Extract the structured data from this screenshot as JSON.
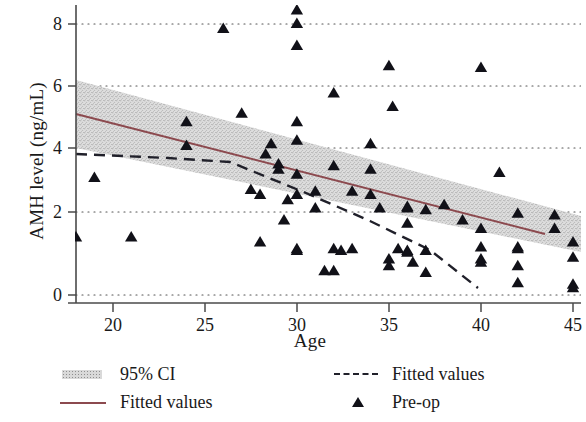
{
  "chart_data": {
    "type": "scatter",
    "title": "",
    "xlabel": "Age",
    "ylabel": "AMH level (ng/mL)",
    "xlim": [
      18,
      45.6
    ],
    "ylim": [
      -0.45,
      8.75
    ],
    "xticks": [
      20,
      25,
      30,
      35,
      40,
      45
    ],
    "yticks": [
      0,
      2,
      4,
      6,
      8
    ],
    "grid": "horizontal dotted gridlines at each y tick",
    "legend_position": "below plot, two columns",
    "series": [
      {
        "name": "Pre-op",
        "type": "scatter",
        "marker": "triangle",
        "color": "#111118",
        "points": [
          [
            18.0,
            1.7
          ],
          [
            19.0,
            3.45
          ],
          [
            21.0,
            1.7
          ],
          [
            24.0,
            4.4
          ],
          [
            24.0,
            5.1
          ],
          [
            26.0,
            7.85
          ],
          [
            27.0,
            5.35
          ],
          [
            27.5,
            3.1
          ],
          [
            28.0,
            1.55
          ],
          [
            28.0,
            2.95
          ],
          [
            28.3,
            4.15
          ],
          [
            28.6,
            4.45
          ],
          [
            29.0,
            3.85
          ],
          [
            29.0,
            3.7
          ],
          [
            29.3,
            2.2
          ],
          [
            29.5,
            2.8
          ],
          [
            30.0,
            8.4
          ],
          [
            30.0,
            8.0
          ],
          [
            30.0,
            7.35
          ],
          [
            30.0,
            5.1
          ],
          [
            30.0,
            4.55
          ],
          [
            30.0,
            3.55
          ],
          [
            30.0,
            2.95
          ],
          [
            30.0,
            1.35
          ],
          [
            30.0,
            1.3
          ],
          [
            31.0,
            3.05
          ],
          [
            31.0,
            2.55
          ],
          [
            31.5,
            0.7
          ],
          [
            32.0,
            5.95
          ],
          [
            32.0,
            3.8
          ],
          [
            32.0,
            1.35
          ],
          [
            32.0,
            0.7
          ],
          [
            32.4,
            1.3
          ],
          [
            33.0,
            3.05
          ],
          [
            33.0,
            1.35
          ],
          [
            34.0,
            2.95
          ],
          [
            34.0,
            4.45
          ],
          [
            34.0,
            3.7
          ],
          [
            34.5,
            2.55
          ],
          [
            35.0,
            1.05
          ],
          [
            35.0,
            0.85
          ],
          [
            35.0,
            6.75
          ],
          [
            35.2,
            5.55
          ],
          [
            35.5,
            1.35
          ],
          [
            36.0,
            2.6
          ],
          [
            36.0,
            2.55
          ],
          [
            36.0,
            2.1
          ],
          [
            36.0,
            1.3
          ],
          [
            36.0,
            1.25
          ],
          [
            36.3,
            0.95
          ],
          [
            37.0,
            2.5
          ],
          [
            37.0,
            1.3
          ],
          [
            37.0,
            0.65
          ],
          [
            38.0,
            2.65
          ],
          [
            39.0,
            2.2
          ],
          [
            40.0,
            6.7
          ],
          [
            40.0,
            1.95
          ],
          [
            40.0,
            1.4
          ],
          [
            40.0,
            1.05
          ],
          [
            40.0,
            0.95
          ],
          [
            41.0,
            3.6
          ],
          [
            42.0,
            2.4
          ],
          [
            42.0,
            1.4
          ],
          [
            42.0,
            1.35
          ],
          [
            42.0,
            0.85
          ],
          [
            42.0,
            0.35
          ],
          [
            44.0,
            2.35
          ],
          [
            44.0,
            1.95
          ],
          [
            45.0,
            1.55
          ],
          [
            45.0,
            1.1
          ],
          [
            45.0,
            0.3
          ],
          [
            45.0,
            0.2
          ]
        ]
      },
      {
        "name": "Fitted values",
        "type": "line",
        "style": "solid",
        "color": "#8c4a4f",
        "x": [
          18,
          45
        ],
        "y": [
          5.0,
          1.3
        ]
      },
      {
        "name": "Fitted values",
        "type": "line",
        "style": "dashed",
        "color": "#20202a",
        "x": [
          18,
          28,
          35,
          41,
          45
        ],
        "y": [
          3.85,
          3.7,
          2.55,
          1.4,
          0.2
        ]
      },
      {
        "name": "95% CI",
        "type": "band",
        "color": "#d8d8d8",
        "x": [
          18,
          45
        ],
        "upper": [
          6.15,
          1.95
        ],
        "lower": [
          3.85,
          0.65
        ]
      }
    ]
  },
  "axes": {
    "y_title": "AMH level (ng/mL)",
    "x_title": "Age",
    "y_tick_labels": [
      "0",
      "2",
      "4",
      "6",
      "8"
    ],
    "x_tick_labels": [
      "20",
      "25",
      "30",
      "35",
      "40",
      "45"
    ]
  },
  "legend": {
    "left": [
      {
        "label": "95% CI",
        "key": "band-swatch"
      },
      {
        "label": "Fitted values",
        "key": "solid-line-swatch"
      }
    ],
    "right": [
      {
        "label": "Fitted values",
        "key": "dashed-line-swatch"
      },
      {
        "label": "Pre-op",
        "key": "triangle-marker-swatch"
      }
    ]
  },
  "colors": {
    "solid_fit": "#8c4a4f",
    "dashed_fit": "#20202a",
    "ci_band": "#d8d8d8",
    "marker": "#111118",
    "axis": "#4a4a4a"
  }
}
